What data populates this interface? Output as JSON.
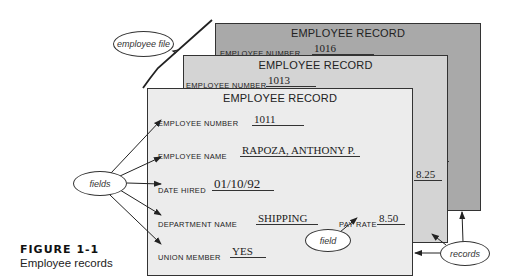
{
  "figure": {
    "number": "FIGURE 1-1",
    "caption": "Employee records"
  },
  "callouts": {
    "employee_file": "employee file",
    "fields": "fields",
    "field": "field",
    "records": "records"
  },
  "records": [
    {
      "title": "EMPLOYEE RECORD",
      "employee_number_label": "EMPLOYEE NUMBER",
      "employee_number": "1016",
      "pay_rate": "9.75"
    },
    {
      "title": "EMPLOYEE RECORD",
      "employee_number_label": "EMPLOYEE NUMBER",
      "employee_number": "1013",
      "pay_rate": "8.25"
    },
    {
      "title": "EMPLOYEE RECORD",
      "employee_number_label": "EMPLOYEE NUMBER",
      "employee_number": "1011",
      "employee_name_label": "EMPLOYEE NAME",
      "employee_name": "RAPOZA, ANTHONY P.",
      "date_hired_label": "DATE HIRED",
      "date_hired": "01/10/92",
      "department_name_label": "DEPARTMENT NAME",
      "department_name": "SHIPPING",
      "pay_rate_label": "PAY RATE",
      "pay_rate": "8.50",
      "union_member_label": "UNION MEMBER",
      "union_member": "YES"
    }
  ],
  "colors": {
    "back_card": "#a9a9a9",
    "middle_card": "#d4d4d4",
    "front_card": "#ececec"
  }
}
